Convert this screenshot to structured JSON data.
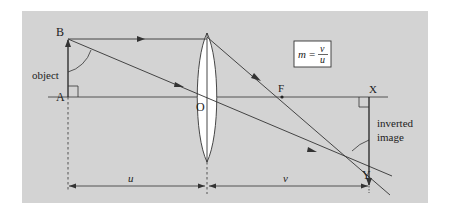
{
  "diagram": {
    "type": "ray diagram - converging lens forming inverted real image",
    "background_color": "#d3d3d3",
    "line_color": "#333333",
    "points": {
      "A": "A",
      "B": "B",
      "O": "O",
      "F": "F",
      "X": "X",
      "Y": "Y"
    },
    "labels": {
      "object": "object",
      "image_line1": "inverted",
      "image_line2": "image",
      "u": "u",
      "v": "v"
    },
    "formula": {
      "lhs": "m",
      "equals": "=",
      "numerator": "v",
      "denominator": "u"
    }
  }
}
